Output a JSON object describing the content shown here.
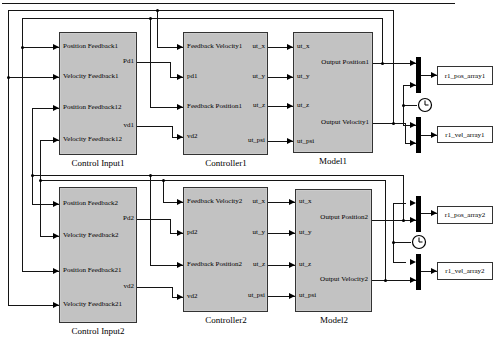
{
  "blocks": {
    "ci1": {
      "name": "Control Input1",
      "in": [
        "Position Feedback1",
        "Velocity Feedback1",
        "Position Feedback12",
        "Velocity Feedback12"
      ],
      "out": [
        "Pd1",
        "vd1"
      ]
    },
    "c1": {
      "name": "Controller1",
      "in": [
        "Feedback Velocity1",
        "pd1",
        "Feedback Position1",
        "vd2"
      ],
      "out": [
        "ut_x",
        "ut_y",
        "ut_z",
        "ut_psi"
      ]
    },
    "m1": {
      "name": "Model1",
      "in": [
        "ut_x",
        "ut_y",
        "ut_z",
        "ut_psi"
      ],
      "out": [
        "Output Position1",
        "Output Velocity1"
      ]
    },
    "ci2": {
      "name": "Control Input2",
      "in": [
        "Position Feedback2",
        "Velocity Feedback2",
        "Position Feedback21",
        "Velocity Feedback21"
      ],
      "out": [
        "Pd2",
        "vd2"
      ]
    },
    "c2": {
      "name": "Controller2",
      "in": [
        "Feedback Velocity2",
        "pd2",
        "Feedback Position2",
        "vd2"
      ],
      "out": [
        "ut_x",
        "ut_y",
        "ut_z",
        "ut_psi"
      ]
    },
    "m2": {
      "name": "Model2",
      "in": [
        "ut_x",
        "ut_y",
        "ut_z",
        "ut_psi"
      ],
      "out": [
        "Output Position2",
        "Output Velocity2"
      ]
    }
  },
  "sinks": {
    "pos1": "r1_pos_array1",
    "vel1": "r1_vel_array1",
    "pos2": "r1_pos_array2",
    "vel2": "r1_vel_array2"
  },
  "colors": {
    "block_fill": "#c2c2c2",
    "line": "#000000",
    "background": "#ffffff"
  }
}
